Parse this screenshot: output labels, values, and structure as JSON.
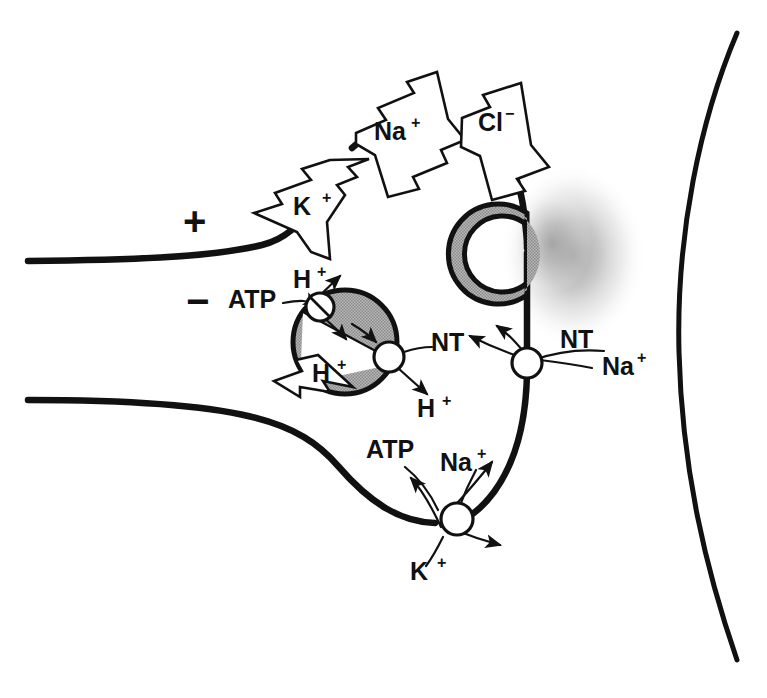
{
  "figure": {
    "kind": "biology-diagram"
  },
  "colors": {
    "ink": "#111111",
    "vesicle_gray": "#a6a6a6",
    "cloud_gray": "#c9c9c9",
    "background": "#ffffff"
  },
  "membrane_charges": {
    "outside_label": "+",
    "inside_label": "−"
  },
  "channel_arrows": [
    {
      "name": "potassium-channel-arrow",
      "label": "K",
      "charge": "+",
      "direction": "bidirectional-down-left"
    },
    {
      "name": "sodium-channel-arrow",
      "label": "Na",
      "charge": "+",
      "direction": "bidirectional-left-and-down-right"
    },
    {
      "name": "chloride-channel-arrow",
      "label": "Cl",
      "charge": "−",
      "direction": "bidirectional-down-left"
    }
  ],
  "vesicle_pump": {
    "name": "vesicular-proton-atpase",
    "energy_label": "ATP",
    "proton_in_label": "H",
    "proton_in_charge": "+",
    "proton_out_label": "H",
    "proton_out_charge": "+"
  },
  "vesicle_transporter": {
    "name": "vesicular-neurotransmitter-transporter",
    "nt_label": "NT",
    "proton_label": "H",
    "proton_charge": "+"
  },
  "reuptake_transporter": {
    "name": "membrane-nt-sodium-cotransporter",
    "nt_label": "NT",
    "sodium_label": "Na",
    "sodium_charge": "+"
  },
  "sodium_potassium_pump": {
    "name": "sodium-potassium-atpase",
    "energy_label": "ATP",
    "sodium_label": "Na",
    "sodium_charge": "+",
    "potassium_label": "K",
    "potassium_charge": "+"
  },
  "structures": {
    "axon_membrane": "presynaptic axon membrane",
    "terminal": "synaptic bouton",
    "docked_vesicle": "fusing synaptic vesicle",
    "cytoplasmic_vesicle": "cytoplasmic synaptic vesicle",
    "released_cloud": "released neurotransmitter cloud",
    "postsynaptic_membrane": "postsynaptic cell membrane"
  }
}
